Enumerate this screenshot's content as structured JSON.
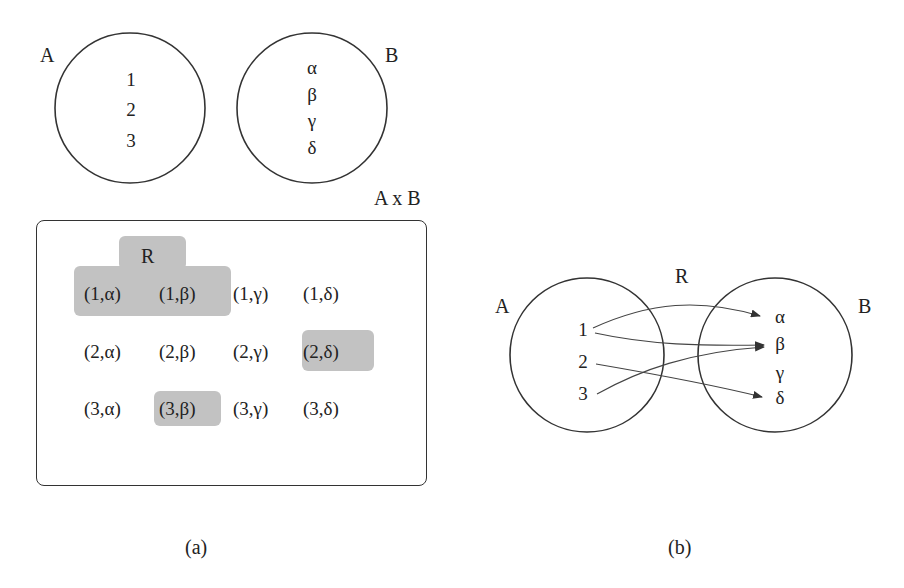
{
  "panel_a": {
    "set_a": {
      "label": "A",
      "elements": [
        "1",
        "2",
        "3"
      ]
    },
    "set_b": {
      "label": "B",
      "elements": [
        "α",
        "β",
        "γ",
        "δ"
      ]
    },
    "product_label": "A x B",
    "relation_label": "R",
    "pairs": [
      [
        "(1,α)",
        "(1,β)",
        "(1,γ)",
        "(1,δ)"
      ],
      [
        "(2,α)",
        "(2,β)",
        "(2,γ)",
        "(2,δ)"
      ],
      [
        "(3,α)",
        "(3,β)",
        "(3,γ)",
        "(3,δ)"
      ]
    ],
    "highlighted_pairs": [
      "(1,α)",
      "(1,β)",
      "(2,δ)",
      "(3,β)"
    ],
    "highlight_color": "#c2c2c2",
    "caption": "(a)"
  },
  "panel_b": {
    "set_a": {
      "label": "A",
      "elements": [
        "1",
        "2",
        "3"
      ]
    },
    "set_b": {
      "label": "B",
      "elements": [
        "α",
        "β",
        "γ",
        "δ"
      ]
    },
    "relation_label": "R",
    "arrows": [
      {
        "from": "1",
        "to": "α"
      },
      {
        "from": "1",
        "to": "β"
      },
      {
        "from": "2",
        "to": "δ"
      },
      {
        "from": "3",
        "to": "β"
      }
    ],
    "caption": "(b)"
  }
}
